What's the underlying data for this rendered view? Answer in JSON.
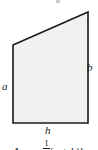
{
  "figure": {
    "type": "right-trapezoid",
    "fill_color": "#f2f1ef",
    "stroke_color": "#1a1a1a",
    "background_color": "#ffffff",
    "vertices": {
      "top_left": [
        13,
        45
      ],
      "top_right": [
        88,
        12
      ],
      "bottom_right": [
        88,
        123
      ],
      "bottom_left": [
        13,
        123
      ]
    },
    "labels": {
      "left_side": "a",
      "right_side": "b",
      "base": "h"
    },
    "caption": {
      "lead": "Area =",
      "fraction_numerator": "1",
      "fraction_denominator": "2",
      "open_paren": "(",
      "term_a": "a",
      "plus": "+",
      "term_b": "b",
      "close_paren": ")",
      "term_h": "h",
      "full_text": "Area = 1/2(a + b)h",
      "cropped": true
    }
  }
}
